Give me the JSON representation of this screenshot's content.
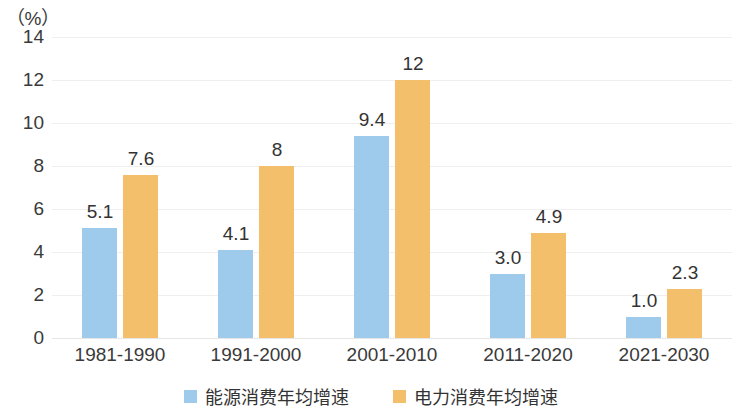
{
  "chart_data": {
    "type": "bar",
    "title": "",
    "subtitle": "",
    "xlabel": "",
    "ylabel": "（%）",
    "unit_caption": "（%）",
    "categories": [
      "1981-1990",
      "1991-2000",
      "2001-2010",
      "2011-2020",
      "2021-2030"
    ],
    "series": [
      {
        "name": "能源消费年均增速",
        "color": "#9ecbec",
        "values": [
          5.1,
          4.1,
          9.4,
          3.0,
          1.0
        ],
        "labels": [
          "5.1",
          "4.1",
          "9.4",
          "3.0",
          "1.0"
        ]
      },
      {
        "name": "电力消费年均增速",
        "color": "#f3bf6b",
        "values": [
          7.6,
          8,
          12,
          4.9,
          2.3
        ],
        "labels": [
          "7.6",
          "8",
          "12",
          "4.9",
          "2.3"
        ]
      }
    ],
    "ylim": [
      0,
      14
    ],
    "yticks": [
      "0",
      "2",
      "4",
      "6",
      "8",
      "10",
      "12",
      "14"
    ],
    "ytick_values": [
      0,
      2,
      4,
      6,
      8,
      10,
      12,
      14
    ],
    "grid": true,
    "grid_color": "#efefef",
    "legend_position": "bottom"
  },
  "legend": {
    "items": [
      {
        "label": "能源消费年均增速",
        "color": "#9ecbec"
      },
      {
        "label": "电力消费年均增速",
        "color": "#f3bf6b"
      }
    ]
  }
}
